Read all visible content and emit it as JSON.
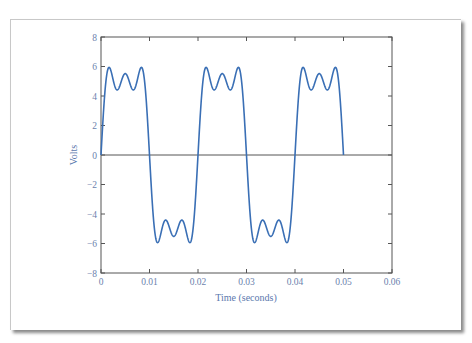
{
  "chart_data": {
    "type": "line",
    "title": "",
    "xlabel": "Time (seconds)",
    "ylabel": "Volts",
    "xlim": [
      0,
      0.06
    ],
    "ylim": [
      -8,
      8
    ],
    "xticks": [
      0,
      0.01,
      0.02,
      0.03,
      0.04,
      0.05,
      0.06
    ],
    "xtick_labels": [
      "0",
      "0.01",
      "0.02",
      "0.03",
      "0.04",
      "0.05",
      "0.06"
    ],
    "yticks": [
      -8,
      -6,
      -4,
      -2,
      0,
      2,
      4,
      6,
      8
    ],
    "ytick_labels": [
      "−8",
      "−6",
      "−4",
      "−2",
      "0",
      "2",
      "4",
      "6",
      "8"
    ],
    "grid": false,
    "zero_line": true,
    "series": [
      {
        "name": "Fourier square wave (harmonics 1, 3, 5)",
        "function": "(4*A/pi)*(sin(w t) + sin(3 w t)/3 + sin(5 w t)/5)",
        "amplitude_A": 5,
        "period": 0.02,
        "t_range": [
          0,
          0.05
        ],
        "approx_peaks": 5.9,
        "approx_center_value": 5.5,
        "approx_inner_dips": 4.5,
        "color": "#3a6fb5"
      }
    ]
  },
  "colors": {
    "line": "#3a6fb5",
    "axis": "#555555",
    "tick_label": "#6b82ad"
  }
}
